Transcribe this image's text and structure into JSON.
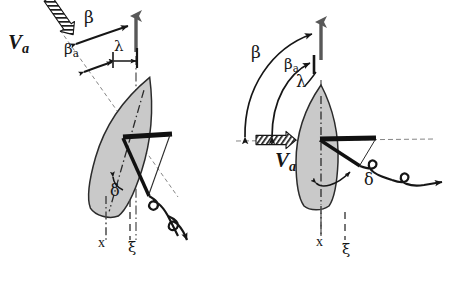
{
  "figure": {
    "type": "technical-diagram",
    "background_color": "#ffffff",
    "ink_color": "#161616",
    "hull_fill_color": "#c9c9c9",
    "hull_outline_color": "#2b2b2b",
    "course_arrow_color": "#585858",
    "axis_color": "#4a4a4a"
  },
  "panels": [
    {
      "id": "left",
      "name": "left-diagram",
      "heading_deg": 18,
      "wind_vector": {
        "label": "V",
        "sub": "a",
        "style": "hatched-arrow",
        "direction_deg": 218
      },
      "angles": [
        {
          "symbol": "β",
          "name": "beta",
          "label_x": 85,
          "label_y": 16
        },
        {
          "symbol": "β",
          "sub": "a",
          "name": "beta-a",
          "label_x": 66,
          "label_y": 47
        },
        {
          "symbol": "λ",
          "name": "lambda",
          "label_x": 104,
          "label_y": 44
        },
        {
          "symbol": "δ",
          "name": "delta",
          "label_x": 111,
          "label_y": 188
        }
      ],
      "axes": [
        {
          "symbol": "x",
          "name": "x-axis",
          "line": "dash-dot",
          "label_x": 99,
          "label_y": 245
        },
        {
          "symbol": "ξ",
          "name": "xi-axis",
          "line": "dashed",
          "label_x": 130,
          "label_y": 247
        }
      ],
      "course_arrow": {
        "name": "course-arrow",
        "orientation": "vertical-up"
      },
      "rudder_bar": {
        "name": "rudder-bar",
        "style": "thick-black"
      },
      "tether": {
        "name": "tether-line",
        "style": "looped-curve-arrow"
      }
    },
    {
      "id": "right",
      "name": "right-diagram",
      "heading_deg": 0,
      "wind_vector": {
        "label": "V",
        "sub": "a",
        "style": "hatched-arrow",
        "direction_deg": 180
      },
      "angles": [
        {
          "symbol": "β",
          "name": "beta",
          "label_x": 252,
          "label_y": 50
        },
        {
          "symbol": "β",
          "sub": "a",
          "name": "beta-a",
          "label_x": 286,
          "label_y": 63
        },
        {
          "symbol": "λ",
          "name": "lambda",
          "label_x": 315,
          "label_y": 80
        },
        {
          "symbol": "δ",
          "name": "delta",
          "label_x": 368,
          "label_y": 178
        }
      ],
      "axes": [
        {
          "symbol": "x",
          "name": "x-axis",
          "line": "dash-dot",
          "label_x": 318,
          "label_y": 243
        },
        {
          "symbol": "ξ",
          "name": "xi-axis",
          "line": "dashed",
          "label_x": 344,
          "label_y": 249
        }
      ],
      "course_arrow": {
        "name": "course-arrow",
        "orientation": "vertical-up"
      },
      "rudder_bar": {
        "name": "rudder-bar",
        "style": "thick-black"
      },
      "tether": {
        "name": "tether-line",
        "style": "looped-curve-arrow"
      }
    }
  ],
  "labels": {
    "va_v": "V",
    "va_a": "a",
    "beta": "β",
    "beta_sub": "a",
    "lambda": "λ",
    "delta": "δ",
    "x": "x",
    "xi": "ξ"
  }
}
